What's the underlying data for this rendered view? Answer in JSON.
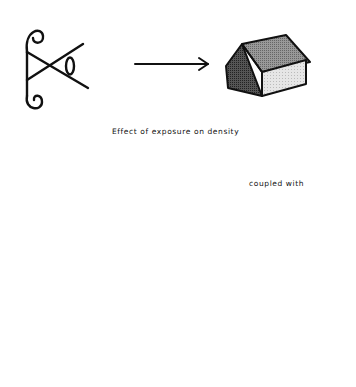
{
  "diagram": {
    "labels": {
      "effect": "Effect of exposure on density",
      "coupled": "coupled with"
    },
    "colors": {
      "ink": "#111111",
      "dark_shade": "#444444",
      "mid_shade": "#8a8a8a",
      "light_shade": "#d9d9d9",
      "very_light": "#f2f2f2",
      "background": "#ffffff"
    },
    "elements": [
      {
        "name": "film-reel-eye-symbol"
      },
      {
        "name": "arrow-right-top"
      },
      {
        "name": "small-shaded-house"
      },
      {
        "name": "dashed-film-line"
      },
      {
        "name": "developing-tank-with-film-spiral"
      },
      {
        "name": "arrow-right-bottom"
      },
      {
        "name": "large-house"
      }
    ]
  }
}
